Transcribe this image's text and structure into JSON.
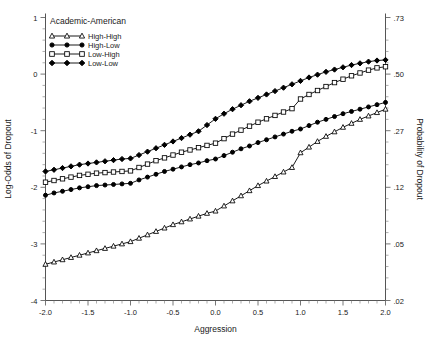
{
  "figure": {
    "legend_title": "Academic-American",
    "x_axis_title": "Aggression",
    "y_axis_left_title": "Log-Odds of Dropout",
    "y_axis_right_title": "Probability of Dropout"
  },
  "chart_data": {
    "type": "line",
    "title": "Academic-American",
    "xlabel": "Aggression",
    "ylabel": "Log-Odds of Dropout",
    "y2label": "Probability of Dropout",
    "xlim": [
      -2.0,
      2.0
    ],
    "ylim": [
      -4.0,
      1.0
    ],
    "grid": false,
    "legend_position": "top-left",
    "xticks": [
      -2.0,
      -1.5,
      -1.0,
      -0.5,
      0.0,
      0.5,
      1.0,
      1.5,
      2.0
    ],
    "xticklabels": [
      "-2.0",
      "-1.5",
      "-1.0",
      "-0.5",
      "0.0",
      "0.5",
      "1.0",
      "1.5",
      "2.0"
    ],
    "yticks": [
      1,
      0,
      -1,
      -2,
      -3,
      -4
    ],
    "yticklabels": [
      "1",
      "0",
      "-1",
      "-2",
      "-3",
      "-4"
    ],
    "y2ticks": [
      1.0,
      0.0,
      -1.0,
      -2.0,
      -3.0,
      -4.0
    ],
    "y2ticklabels": [
      ".73",
      ".50",
      ".27",
      ".12",
      ".05",
      ".02"
    ],
    "x": [
      -2.0,
      -1.9,
      -1.8,
      -1.7,
      -1.6,
      -1.5,
      -1.4,
      -1.3,
      -1.2,
      -1.1,
      -1.0,
      -0.9,
      -0.8,
      -0.7,
      -0.6,
      -0.5,
      -0.4,
      -0.3,
      -0.2,
      -0.1,
      0.0,
      0.1,
      0.2,
      0.3,
      0.4,
      0.5,
      0.6,
      0.7,
      0.8,
      0.9,
      1.0,
      1.1,
      1.2,
      1.3,
      1.4,
      1.5,
      1.6,
      1.7,
      1.8,
      1.9,
      2.0
    ],
    "series": [
      {
        "name": "High-High",
        "marker": "open-triangle",
        "values": [
          -3.36,
          -3.32,
          -3.28,
          -3.24,
          -3.2,
          -3.16,
          -3.12,
          -3.08,
          -3.04,
          -3.0,
          -2.96,
          -2.9,
          -2.84,
          -2.78,
          -2.72,
          -2.66,
          -2.61,
          -2.56,
          -2.51,
          -2.46,
          -2.42,
          -2.33,
          -2.24,
          -2.15,
          -2.06,
          -1.97,
          -1.89,
          -1.81,
          -1.73,
          -1.65,
          -1.39,
          -1.29,
          -1.19,
          -1.1,
          -1.02,
          -0.94,
          -0.87,
          -0.8,
          -0.74,
          -0.68,
          -0.62
        ]
      },
      {
        "name": "High-Low",
        "marker": "filled-circle",
        "values": [
          -2.14,
          -2.1,
          -2.07,
          -2.04,
          -2.01,
          -1.99,
          -1.97,
          -1.96,
          -1.95,
          -1.94,
          -1.93,
          -1.87,
          -1.82,
          -1.77,
          -1.72,
          -1.68,
          -1.64,
          -1.6,
          -1.57,
          -1.53,
          -1.5,
          -1.44,
          -1.38,
          -1.32,
          -1.27,
          -1.21,
          -1.16,
          -1.11,
          -1.06,
          -1.01,
          -0.97,
          -0.91,
          -0.85,
          -0.8,
          -0.75,
          -0.7,
          -0.66,
          -0.62,
          -0.58,
          -0.54,
          -0.5
        ]
      },
      {
        "name": "Low-High",
        "marker": "open-square",
        "values": [
          -1.91,
          -1.88,
          -1.85,
          -1.82,
          -1.79,
          -1.77,
          -1.75,
          -1.74,
          -1.73,
          -1.72,
          -1.71,
          -1.65,
          -1.59,
          -1.53,
          -1.48,
          -1.43,
          -1.38,
          -1.34,
          -1.3,
          -1.26,
          -1.22,
          -1.14,
          -1.06,
          -0.99,
          -0.92,
          -0.85,
          -0.79,
          -0.73,
          -0.67,
          -0.61,
          -0.44,
          -0.36,
          -0.29,
          -0.22,
          -0.15,
          -0.09,
          -0.03,
          0.02,
          0.07,
          0.11,
          0.13
        ]
      },
      {
        "name": "Low-Low",
        "marker": "filled-diamond",
        "values": [
          -1.72,
          -1.69,
          -1.66,
          -1.63,
          -1.6,
          -1.58,
          -1.56,
          -1.54,
          -1.52,
          -1.5,
          -1.49,
          -1.43,
          -1.37,
          -1.31,
          -1.25,
          -1.19,
          -1.13,
          -1.07,
          -1.01,
          -0.9,
          -0.79,
          -0.7,
          -0.62,
          -0.55,
          -0.48,
          -0.42,
          -0.36,
          -0.3,
          -0.24,
          -0.18,
          -0.12,
          -0.06,
          -0.01,
          0.04,
          0.08,
          0.12,
          0.16,
          0.19,
          0.22,
          0.24,
          0.25
        ]
      }
    ]
  }
}
